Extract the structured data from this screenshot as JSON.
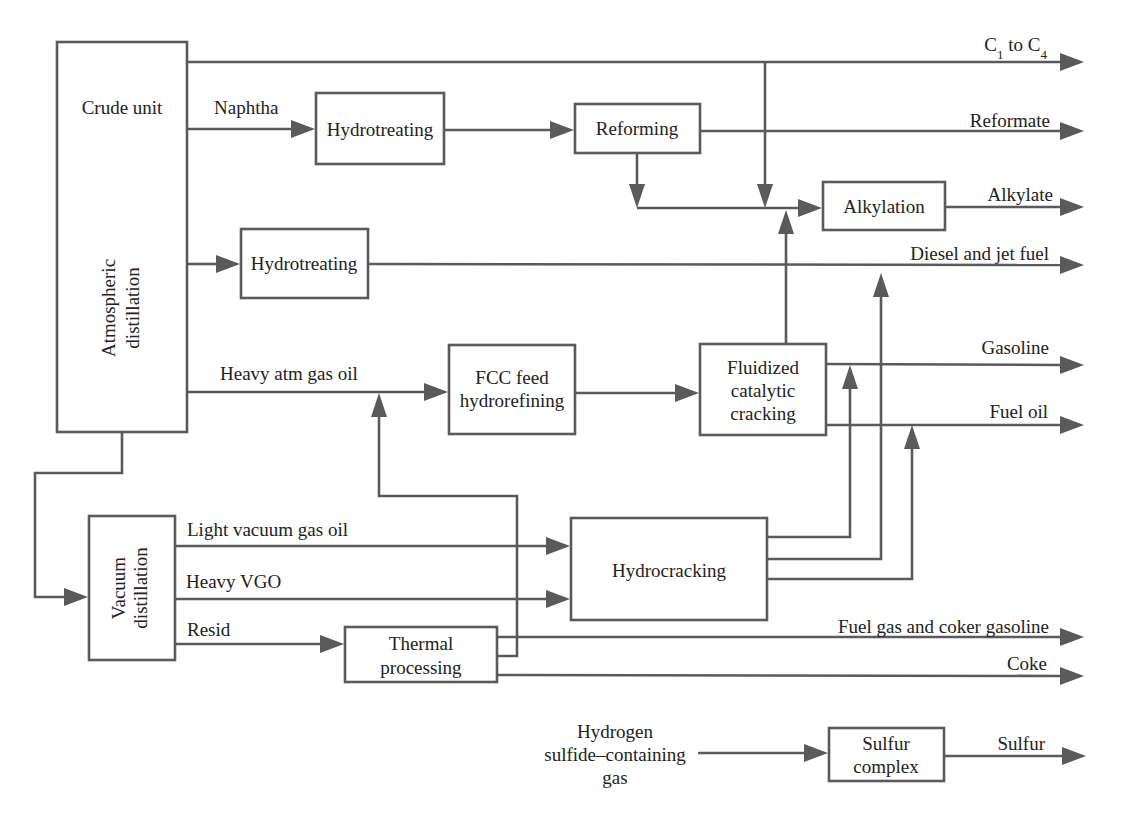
{
  "diagram": {
    "type": "process-flow",
    "colors": {
      "line": "#5a5a5a",
      "text": "#222222",
      "background": "#ffffff"
    },
    "units": {
      "crude_unit": {
        "title": "Crude unit",
        "subtitle_line1": "Atmospheric",
        "subtitle_line2": "distillation"
      },
      "hydrotreating_naphtha": {
        "label": "Hydrotreating"
      },
      "reforming": {
        "label": "Reforming"
      },
      "alkylation": {
        "label": "Alkylation"
      },
      "hydrotreating_diesel": {
        "label": "Hydrotreating"
      },
      "fcc_feed": {
        "line1": "FCC feed",
        "line2": "hydrorefining"
      },
      "fcc": {
        "line1": "Fluidized",
        "line2": "catalytic",
        "line3": "cracking"
      },
      "vacuum": {
        "line1": "Vacuum",
        "line2": "distillation"
      },
      "hydrocracking": {
        "label": "Hydrocracking"
      },
      "thermal": {
        "line1": "Thermal",
        "line2": "processing"
      },
      "sulfur_complex": {
        "line1": "Sulfur",
        "line2": "complex"
      }
    },
    "streams": {
      "naphtha": "Naphtha",
      "heavy_atm_gas_oil": "Heavy atm gas oil",
      "light_vgo": "Light vacuum gas oil",
      "heavy_vgo": "Heavy VGO",
      "resid": "Resid",
      "h2s_line1": "Hydrogen",
      "h2s_line2": "sulfide–containing",
      "h2s_line3": "gas"
    },
    "products": {
      "c1_c4": {
        "c": "C",
        "sub1": "1",
        "to": " to C",
        "sub2": "4"
      },
      "reformate": "Reformate",
      "alkylate": "Alkylate",
      "diesel_jet": "Diesel and jet fuel",
      "gasoline": "Gasoline",
      "fuel_oil": "Fuel oil",
      "fuel_gas_coker": "Fuel gas and coker gasoline",
      "coke": "Coke",
      "sulfur": "Sulfur"
    }
  }
}
